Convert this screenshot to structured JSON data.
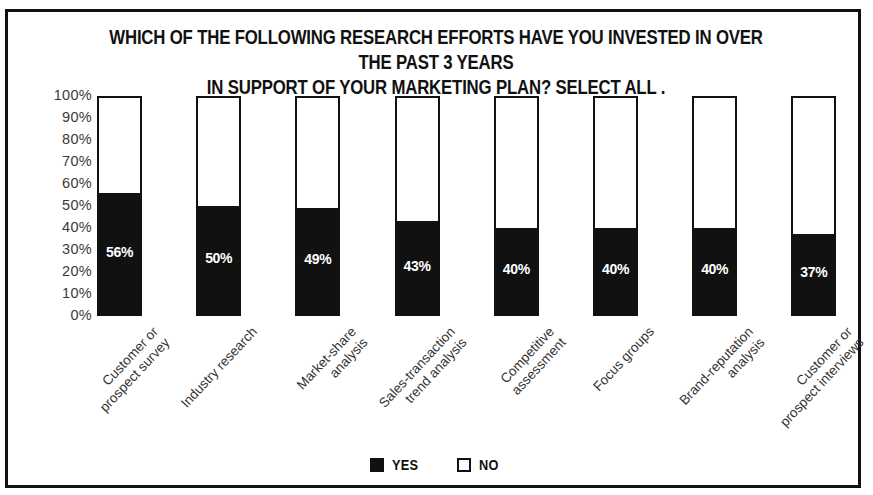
{
  "chart_data": {
    "type": "bar",
    "subtype": "stacked-100-percent",
    "title": "WHICH OF THE FOLLOWING RESEARCH EFFORTS HAVE YOU INVESTED IN OVER THE PAST 3 YEARS\nIN SUPPORT OF YOUR MARKETING PLAN? SELECT ALL .",
    "xlabel": "",
    "ylabel": "",
    "ylim": [
      0,
      100
    ],
    "grid": false,
    "legend_position": "bottom",
    "categories": [
      "Customer or\nprospect survey",
      "Industry research",
      "Market-share\nanalysis",
      "Sales-transaction\ntrend analysis",
      "Competitive\nassessment",
      "Focus groups",
      "Brand-reputation\nanalysis",
      "Customer or\nprospect interviews"
    ],
    "series": [
      {
        "name": "YES",
        "color": "#111111",
        "values": [
          56,
          50,
          49,
          43,
          40,
          40,
          40,
          37
        ]
      },
      {
        "name": "NO",
        "color": "#ffffff",
        "values": [
          44,
          50,
          51,
          57,
          60,
          60,
          60,
          63
        ]
      }
    ],
    "value_labels": {
      "yes": [
        "56%",
        "50%",
        "49%",
        "43%",
        "40%",
        "40%",
        "40%",
        "37%"
      ],
      "no": [
        "44%",
        "50%",
        "51%",
        "57%",
        "60%",
        "60%",
        "60%",
        "63%"
      ]
    },
    "yticks": [
      "100%",
      "90%",
      "80%",
      "70%",
      "60%",
      "50%",
      "40%",
      "30%",
      "20%",
      "10%",
      "0%"
    ],
    "ytick_values": [
      100,
      90,
      80,
      70,
      60,
      50,
      40,
      30,
      20,
      10,
      0
    ]
  },
  "legend": {
    "items": [
      {
        "label": "YES",
        "swatch": "filled-square-icon"
      },
      {
        "label": "NO",
        "swatch": "empty-square-icon"
      }
    ]
  },
  "colors": {
    "ink": "#111111",
    "paper": "#ffffff",
    "tick_text": "#3a3a3a",
    "category_text": "#333333"
  }
}
